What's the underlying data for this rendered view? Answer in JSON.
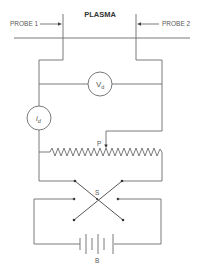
{
  "diagram": {
    "title": "PLASMA",
    "labels": {
      "probe1": "PROBE 1",
      "probe2": "PROBE 2",
      "voltmeter": "V",
      "voltmeter_sub": "d",
      "ammeter": "i",
      "ammeter_sub": "d",
      "potentiometer_tap": "P",
      "switch": "S",
      "battery": "B"
    },
    "components": [
      {
        "id": "probe1",
        "type": "probe",
        "label": "PROBE 1"
      },
      {
        "id": "probe2",
        "type": "probe",
        "label": "PROBE 2"
      },
      {
        "id": "Vd",
        "type": "voltmeter",
        "label": "Vd"
      },
      {
        "id": "id",
        "type": "ammeter",
        "label": "id"
      },
      {
        "id": "P",
        "type": "potentiometer",
        "label": "P"
      },
      {
        "id": "S",
        "type": "reversing-switch (DPDT)",
        "label": "S"
      },
      {
        "id": "B",
        "type": "battery",
        "label": "B"
      }
    ]
  }
}
